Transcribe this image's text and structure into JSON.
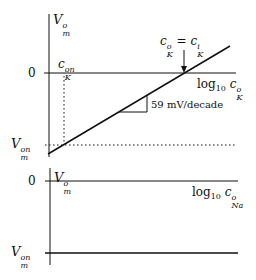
{
  "diagrams": [
    {
      "name": "potassium",
      "y_axis_label": {
        "base": "V",
        "sup": "o",
        "sub": "m"
      },
      "x_axis_label": {
        "prefix": "log",
        "prefix_sub": "10",
        "var": "c",
        "sup": "o",
        "sub": "K"
      },
      "zero_tick": "0",
      "von_label": {
        "base": "V",
        "sup": "on",
        "sub": "m"
      },
      "c_on_label": {
        "base": "c",
        "sup": "on",
        "sub": "K"
      },
      "equality_annotation": {
        "lhs_base": "c",
        "lhs_sup": "o",
        "lhs_sub": "K",
        "eq": "=",
        "rhs_base": "c",
        "rhs_sup": "i",
        "rhs_sub": "K"
      },
      "slope_label": "59 mV/decade"
    },
    {
      "name": "sodium",
      "y_axis_label": {
        "base": "V",
        "sup": "o",
        "sub": "m"
      },
      "x_axis_label": {
        "prefix": "log",
        "prefix_sub": "10",
        "var": "c",
        "sup": "o",
        "sub": "Na"
      },
      "zero_tick": "0",
      "von_label": {
        "base": "V",
        "sup": "on",
        "sub": "m"
      }
    }
  ],
  "colors": {
    "ink": "#111111",
    "background": "#ffffff"
  }
}
